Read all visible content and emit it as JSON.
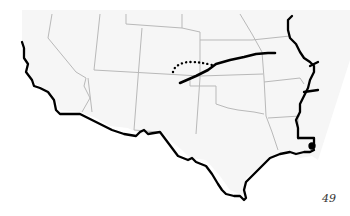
{
  "map": {
    "region": "Southwestern and South-Central United States",
    "colors": {
      "land_fill": "#f6f6f6",
      "state_border": "#b9b9b9",
      "outline": "#000000",
      "route": "#000000",
      "background": "#ffffff"
    },
    "features": [
      {
        "name": "state-borders",
        "style": "thin gray lines"
      },
      {
        "name": "coast-and-boundary-outline",
        "style": "heavy black line"
      },
      {
        "name": "route-solid",
        "style": "heavy black line"
      },
      {
        "name": "route-dotted",
        "style": "black dotted arc"
      }
    ]
  },
  "page": {
    "number": "49"
  }
}
